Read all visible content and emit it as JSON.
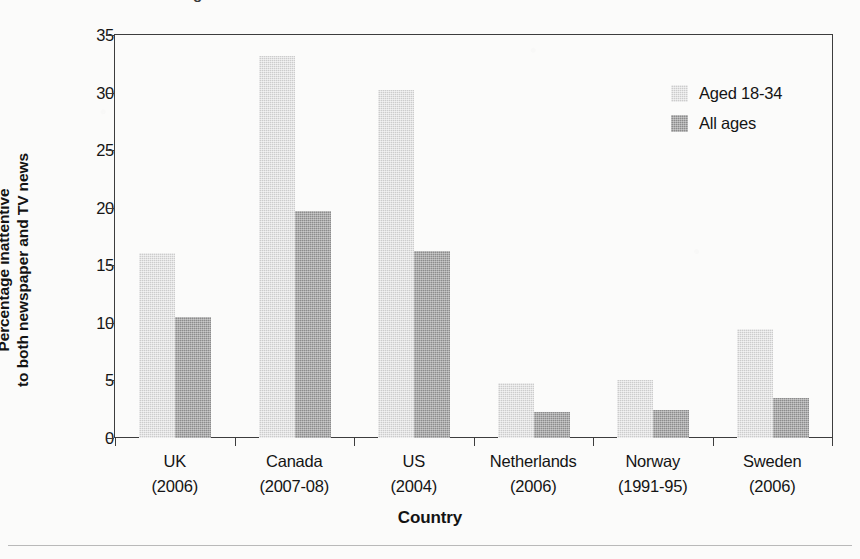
{
  "figure": {
    "background_color": "#fbfbfa",
    "frame_color": "#3d3d3d",
    "title_fragment": "g"
  },
  "chart_data": {
    "type": "bar",
    "title": "",
    "xlabel": "Country",
    "ylabel": "Percentage inattentive to both newspaper and TV news",
    "ylabel_line1": "Percentage inattentive",
    "ylabel_line2": "to both newspaper and TV news",
    "categories": [
      "UK (2006)",
      "Canada (2007-08)",
      "US (2004)",
      "Netherlands (2006)",
      "Norway (1991-95)",
      "Sweden (2006)"
    ],
    "category_lines": [
      {
        "name": "UK",
        "period": "(2006)"
      },
      {
        "name": "Canada",
        "period": "(2007-08)"
      },
      {
        "name": "US",
        "period": "(2004)"
      },
      {
        "name": "Netherlands",
        "period": "(2006)"
      },
      {
        "name": "Norway",
        "period": "(1991-95)"
      },
      {
        "name": "Sweden",
        "period": "(2006)"
      }
    ],
    "series": [
      {
        "name": "Aged 18-34",
        "color": "#cccccc",
        "values": [
          16.1,
          33.2,
          30.2,
          4.8,
          5.0,
          9.5
        ]
      },
      {
        "name": "All ages",
        "color": "#8c8c8c",
        "values": [
          10.5,
          19.7,
          16.2,
          2.3,
          2.4,
          3.5
        ]
      }
    ],
    "ylim": [
      0,
      35
    ],
    "yticks": [
      0,
      5,
      10,
      15,
      20,
      25,
      30,
      35
    ],
    "ytick_labels": [
      "0",
      "5",
      "10",
      "15",
      "20",
      "25",
      "30",
      "35"
    ],
    "grid": false,
    "legend_position": "top-right",
    "legend_entries": [
      "Aged 18-34",
      "All ages"
    ]
  }
}
